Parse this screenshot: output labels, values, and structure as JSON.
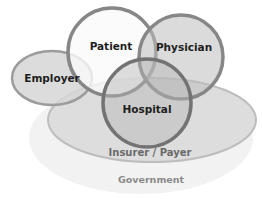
{
  "diagram": {
    "type": "venn",
    "sets": [
      {
        "id": "government",
        "label": "Government",
        "fill": "#f1f1f1",
        "stroke": "#f1f1f1"
      },
      {
        "id": "insurer",
        "label": "Insurer / Payer",
        "fill": "#dcdcdc",
        "stroke": "#b8b8b8"
      },
      {
        "id": "employer",
        "label": "Employer",
        "fill": "#d8d8d8",
        "stroke": "#9a9a9a"
      },
      {
        "id": "patient",
        "label": "Patient",
        "fill": "#fafafa",
        "stroke": "#858585"
      },
      {
        "id": "physician",
        "label": "Physician",
        "fill": "#cfcfcf",
        "stroke": "#858585"
      },
      {
        "id": "hospital",
        "label": "Hospital",
        "fill": "#cdcdcd",
        "stroke": "#7a7a7a"
      }
    ]
  },
  "labels": {
    "patient": "Patient",
    "physician": "Physician",
    "employer": "Employer",
    "hospital": "Hospital",
    "insurer": "Insurer / Payer",
    "government": "Government"
  }
}
